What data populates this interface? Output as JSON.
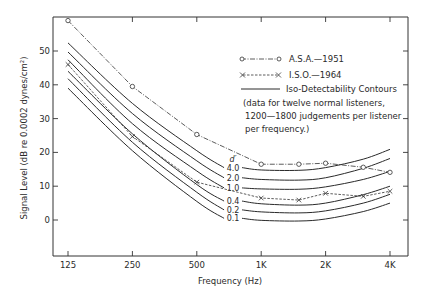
{
  "chart_data": {
    "type": "line",
    "title": "",
    "xlabel": "Frequency (Hz)",
    "ylabel": "Signal Level (dB re 0.0002 dynes/cm²)",
    "xscale": "log",
    "x_ticks": [
      125,
      250,
      500,
      1000,
      2000,
      4000
    ],
    "x_tick_labels": [
      "125",
      "250",
      "500",
      "1K",
      "2K",
      "4K"
    ],
    "y_ticks": [
      0,
      10,
      20,
      30,
      40,
      50
    ],
    "y_tick_labels": [
      "0",
      "10",
      "20",
      "30",
      "40",
      "50"
    ],
    "xlim": [
      100,
      5000
    ],
    "ylim": [
      -10.5,
      60
    ],
    "grid": false,
    "legend": {
      "position": "upper right",
      "entries": [
        {
          "label": "A.S.A.—1951",
          "style": "dash-dot with open circles"
        },
        {
          "label": "I.S.O.—1964",
          "style": "dashed with x markers"
        },
        {
          "label": "Iso-Detectability Contours",
          "style": "solid"
        }
      ],
      "note": [
        "(data for twelve normal listeners,",
        "1200—1800 judgements per listener",
        "per frequency.)"
      ]
    },
    "series": [
      {
        "name": "A.S.A.—1951",
        "marker": "o",
        "x": [
          125,
          250,
          500,
          1000,
          1500,
          2000,
          3000,
          4000
        ],
        "y": [
          59,
          39.5,
          25.3,
          16.5,
          16.5,
          16.8,
          15.6,
          14.1
        ]
      },
      {
        "name": "I.S.O.—1964",
        "marker": "x",
        "x": [
          125,
          250,
          500,
          1000,
          1500,
          2000,
          3000,
          4000
        ],
        "y": [
          46,
          24.7,
          11.2,
          6.5,
          5.9,
          7.9,
          7.0,
          8.5
        ]
      }
    ],
    "contours": {
      "header": "d′",
      "label_frequency": 700,
      "x": [
        125,
        250,
        500,
        700,
        1000,
        1500,
        2000,
        3000,
        4000
      ],
      "lines": [
        {
          "name": "4.0",
          "y": [
            52.4,
            34.5,
            20.5,
            15.5,
            14.8,
            14.7,
            15.5,
            18.0,
            20.9
          ]
        },
        {
          "name": "2.0",
          "y": [
            49.7,
            31.5,
            17.5,
            12.5,
            12.0,
            11.8,
            12.5,
            15.3,
            18.2
          ]
        },
        {
          "name": "1.0",
          "y": [
            47.4,
            28.5,
            14.5,
            9.5,
            9.2,
            9.1,
            9.8,
            12.0,
            14.4
          ]
        },
        {
          "name": "0.4",
          "y": [
            44.0,
            25.5,
            10.5,
            5.6,
            4.8,
            4.4,
            5.0,
            7.5,
            10.0
          ]
        },
        {
          "name": "0.2",
          "y": [
            41.8,
            23.0,
            8.2,
            3.0,
            2.4,
            2.1,
            2.7,
            5.0,
            7.6
          ]
        },
        {
          "name": "0.1",
          "y": [
            39.0,
            20.5,
            5.5,
            0.5,
            -0.1,
            -0.3,
            0.3,
            2.5,
            5.0
          ]
        }
      ]
    }
  }
}
